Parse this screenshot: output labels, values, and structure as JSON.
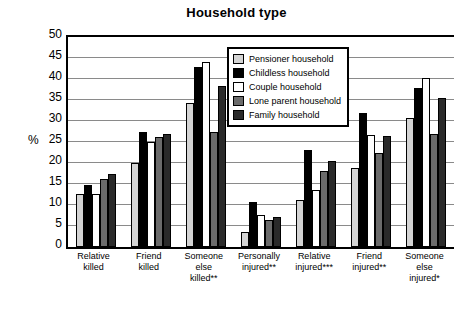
{
  "chart_data": {
    "type": "bar",
    "title": "Household type",
    "xlabel": "",
    "ylabel": "%",
    "ylim": [
      0,
      50
    ],
    "yticks": [
      0,
      5,
      10,
      15,
      20,
      25,
      30,
      35,
      40,
      45,
      50
    ],
    "grid": true,
    "legend_position": "top-right-inside",
    "categories": [
      "Relative\nkilled",
      "Friend\nkilled",
      "Someone\nelse\nkilled**",
      "Personally\ninjured**",
      "Relative\ninjured***",
      "Friend\ninjured**",
      "Someone\nelse\ninjured*"
    ],
    "category_lines": [
      [
        "Relative",
        "killed"
      ],
      [
        "Friend",
        "killed"
      ],
      [
        "Someone",
        "else",
        "killed**"
      ],
      [
        "Personally",
        "injured**"
      ],
      [
        "Relative",
        "injured***"
      ],
      [
        "Friend",
        "injured**"
      ],
      [
        "Someone",
        "else",
        "injured*"
      ]
    ],
    "series": [
      {
        "name": "Pensioner household",
        "color": "#d4d4d4",
        "values": [
          12.7,
          20.1,
          34.4,
          3.6,
          11.2,
          18.9,
          30.6
        ]
      },
      {
        "name": "Childless household",
        "color": "#000000",
        "values": [
          14.8,
          27.4,
          42.9,
          10.8,
          23.1,
          32.0,
          37.8
        ]
      },
      {
        "name": "Couple household",
        "color": "#ffffff",
        "values": [
          12.7,
          25.0,
          44.1,
          7.6,
          13.5,
          26.7,
          40.3
        ]
      },
      {
        "name": "Lone parent household",
        "color": "#6b6b6b",
        "values": [
          16.1,
          26.3,
          27.4,
          6.4,
          18.0,
          22.3,
          26.9
        ]
      },
      {
        "name": "Family household",
        "color": "#2a2a2a",
        "values": [
          17.4,
          26.9,
          38.4,
          7.2,
          20.5,
          26.4,
          35.5
        ]
      }
    ]
  },
  "legend": {
    "items": [
      {
        "label": "Pensioner household",
        "color": "#d4d4d4"
      },
      {
        "label": "Childless household",
        "color": "#000000"
      },
      {
        "label": "Couple household",
        "color": "#ffffff"
      },
      {
        "label": "Lone parent household",
        "color": "#6b6b6b"
      },
      {
        "label": "Family household",
        "color": "#2a2a2a"
      }
    ]
  }
}
